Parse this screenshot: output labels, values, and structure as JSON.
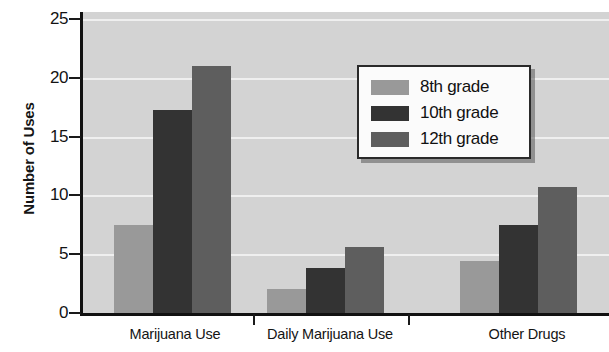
{
  "chart_data": {
    "type": "bar",
    "title": "",
    "xlabel": "",
    "ylabel": "Number of Uses",
    "ylim": [
      0,
      26
    ],
    "yticks": [
      0,
      5,
      10,
      15,
      20,
      25
    ],
    "ytick_labels": [
      "0",
      "5",
      "10",
      "15",
      "20",
      "25"
    ],
    "grid": "horizontal",
    "legend_position": "upper right",
    "categories": [
      "Marijuana Use",
      "Daily Marijuana Use",
      "Other Drugs"
    ],
    "series": [
      {
        "name": "8th grade",
        "color": "#999999",
        "values": [
          7.5,
          2.0,
          4.4
        ]
      },
      {
        "name": "10th grade",
        "color": "#333333",
        "values": [
          17.3,
          3.8,
          7.5
        ]
      },
      {
        "name": "12th grade",
        "color": "#5e5e5e",
        "values": [
          21.0,
          5.6,
          10.7
        ]
      }
    ],
    "plot_background": "#d3d3d3",
    "gridline_color": "#efefef",
    "axis_color": "#111111"
  },
  "legend": {
    "items": [
      {
        "label": "8th grade",
        "color": "#999999"
      },
      {
        "label": "10th grade",
        "color": "#333333"
      },
      {
        "label": "12th grade",
        "color": "#5e5e5e"
      }
    ]
  }
}
